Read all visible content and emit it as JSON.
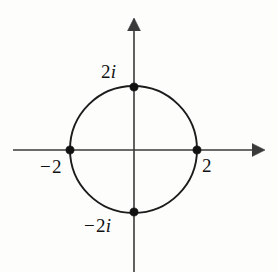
{
  "figure": {
    "kind": "complex-plane-diagram",
    "background_color": "#fdfdfc",
    "ink_color": "#111111",
    "axis_color": "#3a3a3a"
  },
  "axes": {
    "horizontal": {
      "name": "real-axis",
      "arrow": "right",
      "arrow_glyph": "→"
    },
    "vertical": {
      "name": "imaginary-axis",
      "arrow": "up",
      "arrow_glyph": "↑"
    }
  },
  "labels": {
    "top": {
      "text": "2i",
      "number": "2",
      "imaginary_unit": "i"
    },
    "left": {
      "text": "−2",
      "sign": "−",
      "number": "2"
    },
    "right": {
      "text": "2",
      "number": "2"
    },
    "bottom": {
      "text": "−2i",
      "sign": "−",
      "number": "2",
      "imaginary_unit": "i"
    }
  },
  "chart_data": {
    "type": "scatter",
    "title": "",
    "xlabel": "",
    "ylabel": "",
    "xlim": [
      -2.9,
      2.9
    ],
    "ylim": [
      -2.9,
      2.9
    ],
    "grid": false,
    "legend": null,
    "circle": {
      "center": [
        0,
        0
      ],
      "radius": 2,
      "equation": "|z| = 2"
    },
    "points": [
      {
        "label": "2i",
        "x": 0,
        "y": 2,
        "px": 134,
        "py": 87
      },
      {
        "label": "−2",
        "x": -2,
        "y": 0,
        "px": 70,
        "py": 150
      },
      {
        "label": "2",
        "x": 2,
        "y": 0,
        "px": 197,
        "py": 150
      },
      {
        "label": "−2i",
        "x": 0,
        "y": -2,
        "px": 134,
        "py": 212
      }
    ]
  }
}
